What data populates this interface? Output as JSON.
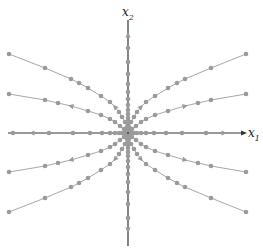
{
  "figure": {
    "type": "phase-portrait",
    "colors": {
      "background": "#ffffff",
      "axis": "#333333",
      "trajectory": "#a8a8a8",
      "point": "#9a9a9a"
    },
    "origin": [
      128,
      133
    ],
    "axes": {
      "x1": {
        "label": "x",
        "subscript": "1",
        "from": [
          8,
          133
        ],
        "to": [
          245,
          133
        ]
      },
      "x2": {
        "label": "x",
        "subscript": "2",
        "from": [
          128,
          20
        ],
        "to": [
          128,
          246
        ]
      }
    },
    "trajectories": [
      {
        "name": "upper-right-outer",
        "points": [
          [
            129,
            127
          ],
          [
            131,
            122
          ],
          [
            134,
            117
          ],
          [
            137,
            112
          ],
          [
            141,
            107
          ],
          [
            146,
            102
          ],
          [
            155,
            96
          ],
          [
            168,
            88
          ],
          [
            177,
            83
          ],
          [
            185,
            79
          ],
          [
            211,
            68
          ],
          [
            246,
            54
          ]
        ],
        "arrow_at": 4
      },
      {
        "name": "upper-right-inner",
        "points": [
          [
            132,
            129
          ],
          [
            136,
            126
          ],
          [
            141,
            122
          ],
          [
            146,
            119
          ],
          [
            155,
            115
          ],
          [
            168,
            111
          ],
          [
            185,
            106
          ],
          [
            198,
            103
          ],
          [
            211,
            100
          ],
          [
            246,
            94
          ]
        ],
        "arrow_at": 6
      },
      {
        "name": "upper-left-outer",
        "points": [
          [
            127,
            127
          ],
          [
            125,
            122
          ],
          [
            122,
            117
          ],
          [
            119,
            112
          ],
          [
            115,
            107
          ],
          [
            110,
            102
          ],
          [
            101,
            96
          ],
          [
            88,
            88
          ],
          [
            79,
            83
          ],
          [
            71,
            79
          ],
          [
            45,
            68
          ],
          [
            9,
            54
          ]
        ],
        "arrow_at": 4
      },
      {
        "name": "upper-left-inner",
        "points": [
          [
            124,
            129
          ],
          [
            120,
            126
          ],
          [
            115,
            122
          ],
          [
            110,
            119
          ],
          [
            101,
            115
          ],
          [
            88,
            111
          ],
          [
            71,
            106
          ],
          [
            58,
            103
          ],
          [
            45,
            100
          ],
          [
            9,
            94
          ]
        ],
        "arrow_at": 6
      },
      {
        "name": "lower-right-outer",
        "points": [
          [
            129,
            139
          ],
          [
            131,
            144
          ],
          [
            134,
            149
          ],
          [
            137,
            154
          ],
          [
            141,
            159
          ],
          [
            146,
            164
          ],
          [
            155,
            170
          ],
          [
            168,
            178
          ],
          [
            177,
            183
          ],
          [
            185,
            187
          ],
          [
            211,
            198
          ],
          [
            246,
            212
          ]
        ],
        "arrow_at": 4
      },
      {
        "name": "lower-right-inner",
        "points": [
          [
            132,
            137
          ],
          [
            136,
            140
          ],
          [
            141,
            144
          ],
          [
            146,
            147
          ],
          [
            155,
            151
          ],
          [
            168,
            155
          ],
          [
            185,
            160
          ],
          [
            198,
            163
          ],
          [
            211,
            166
          ],
          [
            246,
            172
          ]
        ],
        "arrow_at": 6
      },
      {
        "name": "lower-left-outer",
        "points": [
          [
            127,
            139
          ],
          [
            125,
            144
          ],
          [
            122,
            149
          ],
          [
            119,
            154
          ],
          [
            115,
            159
          ],
          [
            110,
            164
          ],
          [
            101,
            170
          ],
          [
            88,
            178
          ],
          [
            79,
            183
          ],
          [
            71,
            187
          ],
          [
            45,
            198
          ],
          [
            9,
            212
          ]
        ],
        "arrow_at": 4
      },
      {
        "name": "lower-left-inner",
        "points": [
          [
            124,
            137
          ],
          [
            120,
            140
          ],
          [
            115,
            144
          ],
          [
            110,
            147
          ],
          [
            101,
            151
          ],
          [
            88,
            155
          ],
          [
            71,
            160
          ],
          [
            58,
            163
          ],
          [
            45,
            166
          ],
          [
            9,
            172
          ]
        ],
        "arrow_at": 6
      }
    ],
    "axis_points": {
      "x1_positive": [
        131,
        134,
        137,
        141,
        146,
        154,
        166,
        182,
        206
      ],
      "x1_negative": [
        125,
        122,
        119,
        115,
        110,
        102,
        90,
        73,
        49,
        13
      ],
      "x2_positive": [
        130,
        127,
        124,
        121,
        118,
        114,
        110,
        105,
        99,
        92,
        84,
        74,
        62,
        48
      ],
      "x2_negative": [
        136,
        139,
        142,
        145,
        148,
        152,
        156,
        161,
        167,
        174,
        182,
        192,
        204,
        218
      ]
    },
    "axis_arrows": {
      "x1_positive": [
        224,
        "right"
      ],
      "x1_negative": [
        32,
        "left"
      ],
      "x2_positive": [
        35,
        "up"
      ],
      "x2_negative": [
        230,
        "down"
      ]
    }
  }
}
